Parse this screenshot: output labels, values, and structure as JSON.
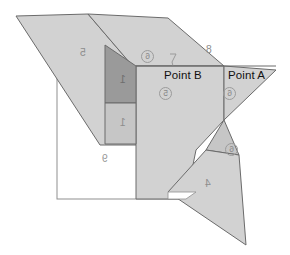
{
  "diagram": {
    "type": "geometric-polygon-overlay",
    "background_color": "#ffffff",
    "fill_light": "#d2d2d2",
    "fill_mid": "#c6c6c6",
    "fill_dark": "#9a9a9a",
    "stroke_color": "#6b6b6b",
    "point_labels": [
      {
        "id": "point-b",
        "text": "Point B",
        "x": 164,
        "y": 70
      },
      {
        "id": "point-a",
        "text": "Point A",
        "x": 228,
        "y": 70
      }
    ],
    "region_numbers": [
      {
        "id": "region-5",
        "text": "5",
        "x": 80,
        "y": 47
      },
      {
        "id": "region-8",
        "text": "8",
        "x": 206,
        "y": 44
      },
      {
        "id": "region-1-dark",
        "text": "1",
        "x": 120,
        "y": 74
      },
      {
        "id": "region-1-mid",
        "text": "1",
        "x": 120,
        "y": 117
      },
      {
        "id": "region-9",
        "text": "9",
        "x": 102,
        "y": 153
      },
      {
        "id": "region-4",
        "text": "4",
        "x": 205,
        "y": 178
      }
    ],
    "circled_markers": [
      {
        "id": "circle-top",
        "text": "6",
        "x": 141,
        "y": 50
      },
      {
        "id": "circle-point-b",
        "text": "5",
        "x": 159,
        "y": 87
      },
      {
        "id": "circle-point-a",
        "text": "6",
        "x": 223,
        "y": 87
      },
      {
        "id": "circle-lower-right",
        "text": "6",
        "x": 225,
        "y": 143
      }
    ],
    "leader_mark": {
      "id": "leader-tick",
      "x": 172,
      "y": 58
    }
  }
}
